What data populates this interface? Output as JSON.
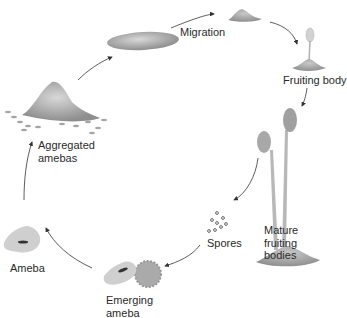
{
  "diagram": {
    "type": "life-cycle",
    "stages": [
      {
        "id": "migration",
        "label": "Migration"
      },
      {
        "id": "fruiting-body",
        "label": "Fruiting body"
      },
      {
        "id": "mature-fruiting-bodies",
        "label": "Mature\nfruiting\nbodies",
        "lines": [
          "Mature",
          "fruiting",
          "bodies"
        ]
      },
      {
        "id": "spores",
        "label": "Spores"
      },
      {
        "id": "emerging-ameba",
        "label": "Emerging\nameba",
        "lines": [
          "Emerging",
          "ameba"
        ]
      },
      {
        "id": "ameba",
        "label": "Ameba"
      },
      {
        "id": "aggregated-amebas",
        "label": "Aggregated\namebas",
        "lines": [
          "Aggregated",
          "amebas"
        ]
      }
    ],
    "flow_direction": "clockwise",
    "colors": {
      "organism": "#9a9a9a",
      "arrow": "#333333",
      "text": "#2a2a2a"
    }
  }
}
